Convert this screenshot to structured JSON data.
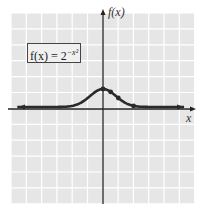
{
  "chart_data": {
    "type": "line",
    "xlabel": "x",
    "ylabel": "f(x)",
    "grid": true,
    "xlim": [
      -6,
      6
    ],
    "ylim": [
      -6,
      6
    ],
    "series": [
      {
        "name": "f(x) = 2^(-x^2)",
        "x": [
          -6,
          -3,
          -2,
          -1.5,
          -1,
          -0.5,
          0,
          0.5,
          1,
          1.5,
          2,
          3,
          6
        ],
        "values": [
          0,
          0.002,
          0.0625,
          0.21,
          0.5,
          0.84,
          1,
          0.84,
          0.5,
          0.21,
          0.0625,
          0.002,
          0
        ]
      }
    ],
    "marked_points": [
      {
        "x": 0,
        "y": 1
      },
      {
        "x": 0.5,
        "y": 0.84
      },
      {
        "x": 1,
        "y": 0.5
      },
      {
        "x": 2,
        "y": 0.0625
      }
    ],
    "arrows": "both ends of curve"
  },
  "labels": {
    "y_axis": "f(x)",
    "x_axis": "x",
    "formula_base": "f(x) = 2",
    "formula_exp": "−x²"
  },
  "colors": {
    "grid_bg": "#e6e6e6",
    "grid_line": "#ffffff",
    "curve": "#2a2a2a",
    "axis": "#222222"
  }
}
